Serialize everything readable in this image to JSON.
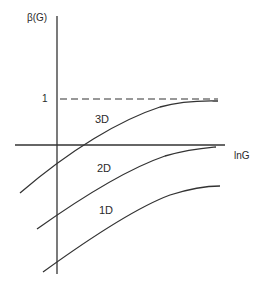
{
  "diagram": {
    "y_axis_label": "β(G)",
    "x_axis_label": "lnG",
    "reference_level_label": "1",
    "curves": [
      {
        "label": "3D"
      },
      {
        "label": "2D"
      },
      {
        "label": "1D"
      }
    ],
    "line_color": "#333333",
    "background": "#ffffff"
  }
}
